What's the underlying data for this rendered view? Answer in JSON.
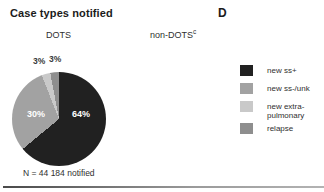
{
  "figure": {
    "title": "Case types notified",
    "panel_label": "D",
    "columns": {
      "left": "DOTS",
      "right": "non-DOTS",
      "right_superscript": "c"
    }
  },
  "chart_data": {
    "type": "pie",
    "title": "DOTS",
    "n_label": "N = 44 184 notified",
    "start_angle_deg": 0,
    "direction": "clockwise",
    "legend_position": "right",
    "slices": [
      {
        "label": "new ss+",
        "value": 64,
        "pct_label": "64%",
        "color": "#212121"
      },
      {
        "label": "new ss-/unk",
        "value": 30,
        "pct_label": "30%",
        "color": "#a2a2a2"
      },
      {
        "label": "new extra-pulmonary",
        "value": 3,
        "pct_label": "3%",
        "color": "#c9c9c9"
      },
      {
        "label": "relapse",
        "value": 3,
        "pct_label": "3%",
        "color": "#8e8e8e"
      }
    ]
  }
}
